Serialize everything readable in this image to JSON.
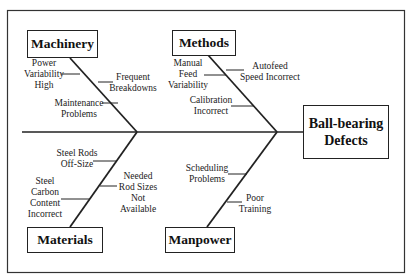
{
  "diagram": {
    "type": "fishbone",
    "effect": {
      "line1": "Ball-bearing",
      "line2": "Defects"
    },
    "categories": {
      "machinery": {
        "label": "Machinery",
        "causes": [
          {
            "lines": [
              "Power",
              "Variability",
              "High"
            ]
          },
          {
            "lines": [
              "Frequent",
              "Breakdowns"
            ]
          },
          {
            "lines": [
              "Maintenance",
              "Problems"
            ]
          }
        ]
      },
      "methods": {
        "label": "Methods",
        "causes": [
          {
            "lines": [
              "Manual",
              "Feed",
              "Variability"
            ]
          },
          {
            "lines": [
              "Autofeed",
              "Speed Incorrect"
            ]
          },
          {
            "lines": [
              "Calibration",
              "Incorrect"
            ]
          }
        ]
      },
      "materials": {
        "label": "Materials",
        "causes": [
          {
            "lines": [
              "Steel Rods",
              "Off-Size"
            ]
          },
          {
            "lines": [
              "Steel",
              "Carbon",
              "Content",
              "Incorrect"
            ]
          },
          {
            "lines": [
              "Needed",
              "Rod Sizes",
              "Not",
              "Available"
            ]
          }
        ]
      },
      "manpower": {
        "label": "Manpower",
        "causes": [
          {
            "lines": [
              "Scheduling",
              "Problems"
            ]
          },
          {
            "lines": [
              "Poor",
              "Training"
            ]
          }
        ]
      }
    },
    "colors": {
      "line": "#222222",
      "background": "#ffffff"
    }
  }
}
